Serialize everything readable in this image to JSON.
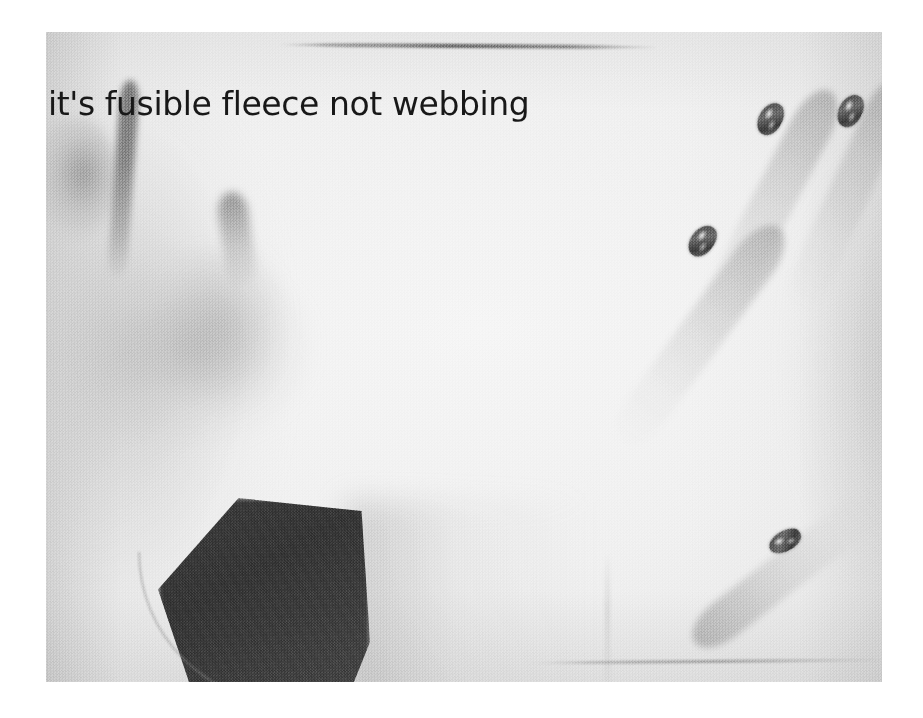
{
  "media": {
    "kind": "photograph-still",
    "caption_text": "it's fusible fleece not webbing",
    "frame": {
      "background_color": "#ffffff",
      "photo_left": 46,
      "photo_top": 32,
      "photo_width": 836,
      "photo_height": 650
    },
    "palette": {
      "page_white": "#ffffff",
      "fabric_highlight": "#f6f6f6",
      "fabric_midtone": "#eaeaea",
      "skin_shadow": "#b0b0b0",
      "deep_shadow": "#747474",
      "sleeve_dark": "#3a3a3a",
      "caption_ink": "#181818",
      "nail_glitter": "#6e6e6e"
    },
    "subjects": {
      "left_hand_label": "left hand holding fleece",
      "right_hand_label": "right hand with decorated nails",
      "sleeve_label": "dark sleeve cuff",
      "fabric_label": "white fusible fleece panel",
      "top_edge_label": "dark table edge line",
      "bottom_edge_label": "fabric seam line"
    },
    "nails": [
      {
        "name": "nail-finger-1"
      },
      {
        "name": "nail-finger-2"
      },
      {
        "name": "nail-finger-3"
      },
      {
        "name": "nail-thumb"
      }
    ]
  }
}
